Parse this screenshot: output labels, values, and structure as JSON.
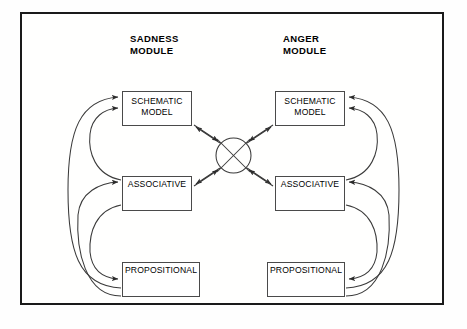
{
  "diagram": {
    "title_visible": false,
    "modules": [
      {
        "id": "sadness",
        "title": "SADNESS\nMODULE",
        "nodes": [
          {
            "id": "sadness-schematic",
            "label": "SCHEMATIC\nMODEL"
          },
          {
            "id": "sadness-associative",
            "label": "ASSOCIATIVE"
          },
          {
            "id": "sadness-propositional",
            "label": "PROPOSITIONAL"
          }
        ]
      },
      {
        "id": "anger",
        "title": "ANGER\nMODULE",
        "nodes": [
          {
            "id": "anger-schematic",
            "label": "SCHEMATIC\nMODEL"
          },
          {
            "id": "anger-associative",
            "label": "ASSOCIATIVE"
          },
          {
            "id": "anger-propositional",
            "label": "PROPOSITIONAL"
          }
        ]
      }
    ],
    "crossover": {
      "id": "crossover-node",
      "label": "",
      "shape": "circle-with-x"
    },
    "colors": {
      "frame_border": "#1a1a1a",
      "box_border": "#4a4a4a",
      "line": "#3a3a3a",
      "text": "#000000",
      "background": "#ffffff"
    }
  }
}
